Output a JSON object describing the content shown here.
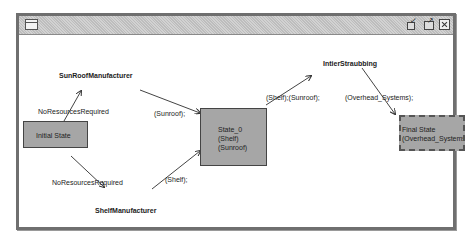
{
  "window": {
    "controls": {
      "minimize": "minimize-icon",
      "maximize": "maximize-icon",
      "close": "close-icon"
    }
  },
  "nodes": {
    "initial": {
      "label": "Initial State"
    },
    "state0": {
      "lines": [
        "State_0",
        "(Shelf)",
        "(Sunroof)"
      ]
    },
    "final": {
      "lines": [
        "Final State",
        "(Overhead_Systems)"
      ]
    }
  },
  "actors": {
    "sunroof_mfr": "SunRoofManufacturer",
    "shelf_mfr": "ShelfManufacturer",
    "integrator": "IntierStraubbing"
  },
  "edge_labels": {
    "no_res_top": "NoResourcesRequired",
    "no_res_bottom": "NoResourcesRequired",
    "sunroof": "(Sunroof);",
    "shelf": "(Shelf);",
    "shelf_sunroof": "(Shelf);(Sunroof);",
    "overhead": "(Overhead_Systems);"
  },
  "colors": {
    "node_fill": "#a6a6a6",
    "border": "#6f6f6f"
  }
}
